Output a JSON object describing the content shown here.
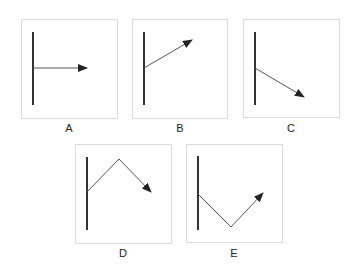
{
  "panels": [
    {
      "label": "A",
      "box": [
        21,
        19,
        96,
        99
      ],
      "bar": [
        33,
        32,
        33,
        105
      ],
      "path": "33,68 87,68",
      "label_pos": [
        69,
        132
      ]
    },
    {
      "label": "B",
      "box": [
        132,
        19,
        95,
        99
      ],
      "bar": [
        144,
        32,
        144,
        105
      ],
      "path": "144,68 192,40",
      "label_pos": [
        180,
        132
      ]
    },
    {
      "label": "C",
      "box": [
        243,
        19,
        96,
        98
      ],
      "bar": [
        255,
        32,
        255,
        105
      ],
      "path": "255,68 304,97",
      "label_pos": [
        291,
        132
      ]
    },
    {
      "label": "D",
      "box": [
        75,
        144,
        96,
        99
      ],
      "bar": [
        87,
        157,
        87,
        230
      ],
      "path": "87,192 119,159 151,192",
      "label_pos": [
        123,
        257
      ]
    },
    {
      "label": "E",
      "box": [
        186,
        144,
        96,
        98
      ],
      "bar": [
        198,
        156,
        198,
        230
      ],
      "path": "198,194 231,227 263,193",
      "label_pos": [
        234,
        257
      ]
    }
  ],
  "colors": {
    "box_border": "#dcdcdc",
    "bar": "#333333",
    "ray": "#555555"
  }
}
